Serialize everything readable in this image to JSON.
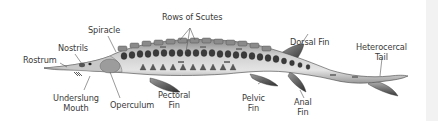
{
  "diagram": {
    "colors": {
      "background": "#ffffff",
      "body_light": "#d6d6d6",
      "body_mid": "#a8a8a8",
      "body_dark": "#4a4a4a",
      "scute_red": "#7a2a2a",
      "label_text": "#3a3a3a",
      "leader_line": "#555555"
    },
    "labels": {
      "rostrum": "Rostrum",
      "nostrils": "Nostrils",
      "spiracle": "Spiracle",
      "rows_of_scutes": "Rows of Scutes",
      "dorsal_fin": "Dorsal Fin",
      "heterocercal_tail_1": "Heterocercal",
      "heterocercal_tail_2": "Tail",
      "underslung_mouth_1": "Underslung",
      "underslung_mouth_2": "Mouth",
      "operculum": "Operculum",
      "pectoral_fin_1": "Pectoral",
      "pectoral_fin_2": "Fin",
      "pelvic_fin_1": "Pelvic",
      "pelvic_fin_2": "Fin",
      "anal_fin_1": "Anal",
      "anal_fin_2": "Fin"
    }
  }
}
